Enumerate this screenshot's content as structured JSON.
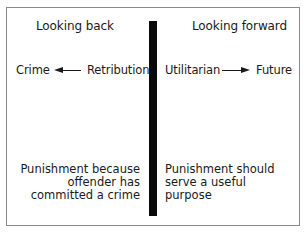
{
  "diagram": {
    "left": {
      "heading": "Looking back",
      "flow": {
        "from": "Retribution",
        "to": "Crime",
        "direction": "right-to-left"
      },
      "description": [
        "Punishment because",
        "offender has",
        "committed a crime"
      ]
    },
    "right": {
      "heading": "Looking forward",
      "flow": {
        "from": "Utilitarian",
        "to": "Future",
        "direction": "left-to-right"
      },
      "description": [
        "Punishment should",
        "serve a useful",
        "purpose"
      ]
    },
    "colors": {
      "divider": "#0a0a0a",
      "border": "#8a8a8a",
      "text": "#1a1a1a"
    }
  }
}
